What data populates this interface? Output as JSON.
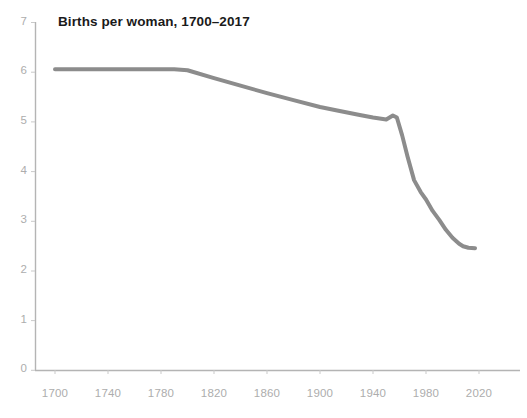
{
  "chart": {
    "title": "Births per woman, 1700–2017",
    "colors": {
      "line": "#8c8c8c",
      "axis": "#b4b4b4",
      "tick_text": "#adadad",
      "title_text": "#1a1a1a",
      "background": "#ffffff"
    }
  },
  "chart_data": {
    "type": "line",
    "title": "Births per woman, 1700–2017",
    "xlabel": "",
    "ylabel": "",
    "xlim": [
      1693,
      2030
    ],
    "ylim": [
      0,
      7
    ],
    "grid": false,
    "legend_position": "none",
    "xticks": [
      1700,
      1740,
      1780,
      1820,
      1860,
      1900,
      1940,
      1980,
      2020
    ],
    "xtick_labels": [
      "1700",
      "1740",
      "1780",
      "1820",
      "1860",
      "1900",
      "1940",
      "1980",
      "2020"
    ],
    "yticks": [
      0,
      1,
      2,
      3,
      4,
      5,
      6,
      7
    ],
    "ytick_labels": [
      "0",
      "1",
      "2",
      "3",
      "4",
      "5",
      "6",
      "7"
    ],
    "series": [
      {
        "name": "Births per woman",
        "color": "#8c8c8c",
        "line_width": 4,
        "x": [
          1700,
          1750,
          1790,
          1800,
          1820,
          1840,
          1860,
          1880,
          1900,
          1913,
          1930,
          1940,
          1950,
          1955,
          1958,
          1962,
          1966,
          1971,
          1976,
          1980,
          1985,
          1990,
          1995,
          2000,
          2005,
          2008,
          2012,
          2017
        ],
        "values": [
          6.05,
          6.05,
          6.05,
          6.03,
          5.87,
          5.72,
          5.57,
          5.43,
          5.29,
          5.22,
          5.13,
          5.08,
          5.04,
          5.12,
          5.08,
          4.72,
          4.3,
          3.82,
          3.58,
          3.43,
          3.2,
          3.02,
          2.82,
          2.66,
          2.54,
          2.49,
          2.46,
          2.45
        ]
      }
    ]
  },
  "axes_geometry": {
    "plot_left": 35,
    "plot_right": 520,
    "plot_top": 22,
    "plot_bottom": 370,
    "x_at_1700": 55,
    "px_per_year": 1.325,
    "y_at_0": 370,
    "px_per_unit": 49.71
  }
}
